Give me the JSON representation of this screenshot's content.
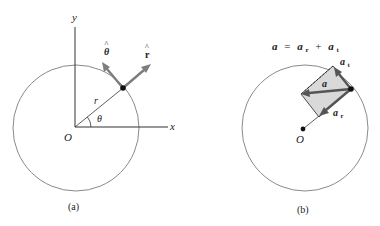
{
  "figure_a": {
    "caption": "(a)",
    "axis_x_label": "x",
    "axis_y_label": "y",
    "origin_label": "O",
    "radius_label": "r",
    "angle_label": "θ",
    "unit_theta_label": "θ",
    "unit_r_label": "r",
    "hat": "^"
  },
  "figure_b": {
    "caption": "(b)",
    "equation": {
      "lhs": "a",
      "equals": "=",
      "term1": "a",
      "term1_sub": "r",
      "plus": "+",
      "term2": "a",
      "term2_sub": "t"
    },
    "origin_label": "O",
    "vector_a_label": "a",
    "vector_at_label": "a",
    "vector_at_sub": "t",
    "vector_ar_label": "a",
    "vector_ar_sub": "r"
  },
  "colors": {
    "circle": "#8a8a8a",
    "vector": "#7d7d7d",
    "vector_dark": "#555555",
    "shaded_region": "#d9d9d9",
    "ink": "#222222"
  }
}
